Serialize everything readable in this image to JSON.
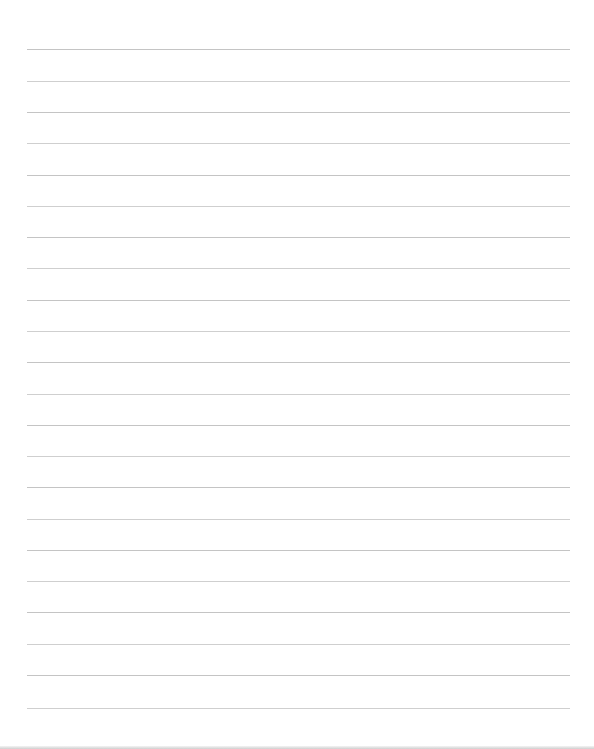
{
  "document": {
    "type": "blank ruled paper",
    "line_count": 22,
    "line_color": "#c4c4c4",
    "background_color": "#ffffff",
    "line_positions_y": [
      49,
      81,
      112,
      143,
      175,
      206,
      237,
      268,
      300,
      331,
      362,
      394,
      425,
      456,
      487,
      519,
      550,
      581,
      612,
      644,
      675,
      708
    ],
    "line_left_x": 27,
    "line_right_x": 570
  }
}
